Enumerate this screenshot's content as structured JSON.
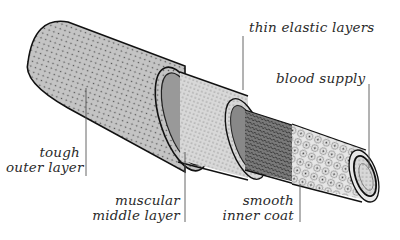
{
  "diagram": {
    "colors": {
      "outline": "#111111",
      "outer_fill": "#b8b8b8",
      "muscle_fill": "#cfcfcf",
      "elastic_fill": "#6a6a6a",
      "inner_fill": "#dcdcdc",
      "leader": "#555555",
      "text": "#2a2a2a"
    },
    "labels": {
      "thin_elastic": "thin elastic layers",
      "blood_supply": "blood supply",
      "tough_line1": "tough",
      "tough_line2": "outer layer",
      "muscular_line1": "muscular",
      "muscular_line2": "middle layer",
      "smooth_line1": "smooth",
      "smooth_line2": "inner coat"
    }
  }
}
